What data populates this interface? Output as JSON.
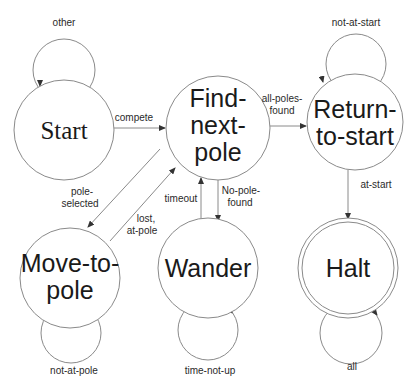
{
  "diagram": {
    "type": "finite-state-machine",
    "states": [
      {
        "id": "start",
        "lines": [
          "Start"
        ],
        "self_loop": "other"
      },
      {
        "id": "find-next-pole",
        "lines": [
          "Find-",
          "next-",
          "pole"
        ]
      },
      {
        "id": "return-to-start",
        "lines": [
          "Return-",
          "to-start"
        ],
        "self_loop": "not-at-start"
      },
      {
        "id": "move-to-pole",
        "lines": [
          "Move-to-",
          "pole"
        ],
        "self_loop": "not-at-pole"
      },
      {
        "id": "wander",
        "lines": [
          "Wander"
        ],
        "self_loop": "time-not-up"
      },
      {
        "id": "halt",
        "lines": [
          "Halt"
        ],
        "self_loop": "all",
        "final": true
      }
    ],
    "transitions": [
      {
        "from": "start",
        "to": "find-next-pole",
        "label_lines": [
          "compete"
        ]
      },
      {
        "from": "find-next-pole",
        "to": "return-to-start",
        "label_lines": [
          "all-poles-",
          "found"
        ]
      },
      {
        "from": "find-next-pole",
        "to": "move-to-pole",
        "label_lines": [
          "pole-",
          "selected"
        ]
      },
      {
        "from": "move-to-pole",
        "to": "find-next-pole",
        "label_lines": [
          "lost,",
          "at-pole"
        ]
      },
      {
        "from": "wander",
        "to": "find-next-pole",
        "label_lines": [
          "timeout"
        ]
      },
      {
        "from": "find-next-pole",
        "to": "wander",
        "label_lines": [
          "No-pole-",
          "found"
        ]
      },
      {
        "from": "return-to-start",
        "to": "halt",
        "label_lines": [
          "at-start"
        ]
      }
    ]
  },
  "colors": {
    "stroke": "#8a8a8a",
    "text": "#1a1a1a",
    "accent_hyphen": "#b03030"
  }
}
